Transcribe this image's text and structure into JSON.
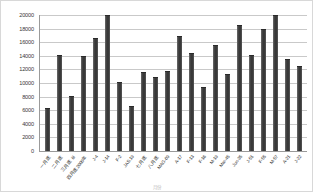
{
  "chart_data": {
    "type": "bar",
    "title": "",
    "xlabel": "",
    "ylabel": "",
    "ylim": [
      0,
      20000
    ],
    "ytick_step": 2000,
    "grid": true,
    "legend": false,
    "orientation": "vertical",
    "bar_color": "#3c3c3c",
    "gridline_color": "#c9c9c9",
    "axis_color": "#9a9a9a",
    "background_color": "#ffffff",
    "yticks": [
      "20000",
      "18000",
      "16000",
      "14000",
      "12000",
      "10000",
      "8000",
      "6000",
      "4000",
      "2000",
      "0"
    ],
    "categories": [
      "一月底",
      "二月底",
      "三月底 III",
      "四月底2000年",
      "J-4",
      "J-14",
      "F-2",
      "JAS.19",
      "七月底",
      "八月底",
      "MAG-09",
      "A-17",
      "F-13",
      "F-16",
      "M-19",
      "Mar-45",
      "Jun-35",
      "J-51",
      "F-55",
      "M-57",
      "A-21",
      "J-22"
    ],
    "values": [
      6200,
      13900,
      8000,
      13800,
      16400,
      19800,
      10000,
      6500,
      11500,
      10800,
      11600,
      16800,
      14300,
      9300,
      15400,
      11200,
      18400,
      14000,
      17800,
      19900,
      13400,
      12300
    ],
    "axis_bottom_note": "月份"
  }
}
